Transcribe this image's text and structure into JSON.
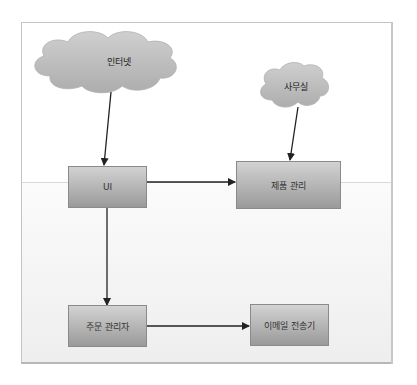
{
  "diagram": {
    "type": "flowchart",
    "nodes": {
      "internet": {
        "label": "인터넷",
        "shape": "cloud"
      },
      "office": {
        "label": "사무실",
        "shape": "cloud"
      },
      "ui": {
        "label": "UI",
        "shape": "box"
      },
      "product_mgmt": {
        "label": "제품 관리",
        "shape": "box"
      },
      "order_manager": {
        "label": "주문 관리자",
        "shape": "box"
      },
      "email_sender": {
        "label": "이메일 전송기",
        "shape": "box"
      }
    },
    "edges": [
      {
        "from": "인터넷",
        "to": "UI"
      },
      {
        "from": "사무실",
        "to": "제품 관리"
      },
      {
        "from": "UI",
        "to": "제품 관리"
      },
      {
        "from": "UI",
        "to": "주문 관리자"
      },
      {
        "from": "주문 관리자",
        "to": "이메일 전송기"
      }
    ],
    "colors": {
      "box_top": "#d2d2d2",
      "box_bottom": "#9a9a9a",
      "cloud_fill": "#bdbdbd",
      "arrow": "#222222"
    }
  }
}
